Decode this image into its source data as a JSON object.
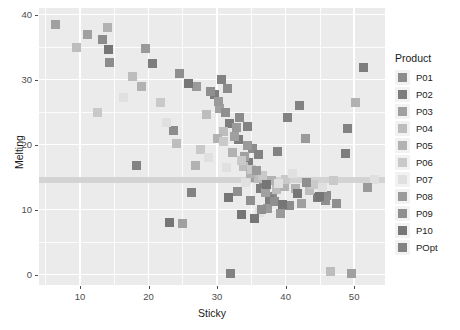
{
  "chart_data": {
    "type": "scatter",
    "title": "",
    "xlabel": "Sticky",
    "ylabel": "Melting",
    "xlim": [
      4.0,
      54.5
    ],
    "ylim": [
      -1.6,
      41.0
    ],
    "xticks": [
      10,
      20,
      30,
      40,
      50
    ],
    "yticks": [
      0,
      10,
      20,
      30,
      40
    ],
    "grid": true,
    "legend_position": "right",
    "legend_title": "Product",
    "marker": "square",
    "marker_size_px": 9,
    "panel_background": "#ebebeb",
    "gridline_color": "#ffffff",
    "reference_band": {
      "orientation": "horizontal",
      "y": 14.5,
      "color": "#d2d2d2"
    },
    "series": [
      {
        "name": "P01",
        "color": "#8c8c8c",
        "points": [
          [
            13.2,
            36.1
          ],
          [
            14.3,
            32.6
          ],
          [
            23.6,
            22.2
          ],
          [
            31.5,
            28.6
          ],
          [
            33.3,
            24.1
          ],
          [
            35.2,
            19.4
          ],
          [
            36.8,
            14.5
          ],
          [
            38.1,
            12.0
          ],
          [
            40.6,
            10.6
          ],
          [
            46.0,
            12.2
          ]
        ]
      },
      {
        "name": "P02",
        "color": "#7d7d7d",
        "points": [
          [
            20.5,
            32.5
          ],
          [
            29.6,
            27.7
          ],
          [
            31.8,
            23.2
          ],
          [
            33.1,
            20.8
          ],
          [
            34.6,
            17.2
          ],
          [
            36.3,
            13.3
          ],
          [
            37.6,
            11.5
          ],
          [
            44.7,
            11.8
          ],
          [
            48.8,
            18.6
          ],
          [
            51.3,
            31.9
          ]
        ]
      },
      {
        "name": "P03",
        "color": "#a0a0a0",
        "points": [
          [
            6.4,
            38.4
          ],
          [
            11.1,
            37.0
          ],
          [
            25.0,
            7.8
          ],
          [
            30.4,
            25.5
          ],
          [
            32.5,
            21.3
          ],
          [
            34.0,
            18.2
          ],
          [
            35.6,
            15.0
          ],
          [
            37.1,
            12.6
          ],
          [
            42.3,
            11.0
          ],
          [
            49.6,
            0.2
          ]
        ]
      },
      {
        "name": "P04",
        "color": "#bdbdbd",
        "points": [
          [
            9.5,
            34.9
          ],
          [
            17.6,
            30.4
          ],
          [
            24.0,
            20.1
          ],
          [
            28.5,
            24.6
          ],
          [
            31.0,
            22.0
          ],
          [
            33.8,
            16.6
          ],
          [
            36.0,
            14.8
          ],
          [
            38.6,
            13.1
          ],
          [
            43.5,
            12.9
          ],
          [
            46.6,
            0.4
          ]
        ]
      },
      {
        "name": "P05",
        "color": "#b2b2b2",
        "points": [
          [
            14.0,
            38.0
          ],
          [
            19.0,
            28.9
          ],
          [
            26.8,
            16.8
          ],
          [
            30.0,
            21.0
          ],
          [
            32.2,
            18.8
          ],
          [
            34.9,
            15.6
          ],
          [
            37.9,
            14.4
          ],
          [
            39.8,
            13.6
          ],
          [
            41.4,
            13.2
          ],
          [
            50.2,
            26.4
          ]
        ]
      },
      {
        "name": "P06",
        "color": "#c9c9c9",
        "points": [
          [
            12.6,
            24.9
          ],
          [
            21.8,
            26.4
          ],
          [
            27.6,
            19.2
          ],
          [
            30.9,
            20.4
          ],
          [
            33.5,
            17.6
          ],
          [
            35.0,
            16.2
          ],
          [
            36.6,
            15.2
          ],
          [
            40.0,
            14.6
          ],
          [
            44.0,
            13.8
          ],
          [
            47.0,
            14.4
          ]
        ]
      },
      {
        "name": "P07",
        "color": "#e0e0e0",
        "points": [
          [
            16.4,
            27.3
          ],
          [
            22.6,
            23.4
          ],
          [
            28.8,
            18.0
          ],
          [
            31.4,
            16.4
          ],
          [
            34.2,
            14.2
          ],
          [
            36.2,
            9.6
          ],
          [
            38.9,
            14.0
          ],
          [
            41.0,
            15.6
          ],
          [
            45.4,
            13.4
          ],
          [
            53.0,
            14.7
          ]
        ]
      },
      {
        "name": "P08",
        "color": "#9a9a9a",
        "points": [
          [
            19.6,
            34.7
          ],
          [
            27.0,
            29.0
          ],
          [
            30.2,
            26.6
          ],
          [
            32.8,
            22.6
          ],
          [
            34.4,
            19.8
          ],
          [
            35.8,
            16.0
          ],
          [
            37.4,
            10.2
          ],
          [
            39.2,
            9.4
          ],
          [
            42.9,
            20.9
          ],
          [
            52.0,
            13.4
          ]
        ]
      },
      {
        "name": "P09",
        "color": "#8f8f8f",
        "points": [
          [
            24.5,
            31.0
          ],
          [
            29.0,
            28.2
          ],
          [
            31.2,
            25.0
          ],
          [
            33.0,
            12.8
          ],
          [
            34.8,
            11.4
          ],
          [
            36.5,
            10.0
          ],
          [
            38.3,
            11.2
          ],
          [
            43.0,
            14.2
          ],
          [
            45.8,
            11.4
          ],
          [
            47.4,
            11.0
          ]
        ]
      },
      {
        "name": "P10",
        "color": "#767676",
        "points": [
          [
            14.1,
            34.6
          ],
          [
            23.0,
            8.0
          ],
          [
            25.8,
            29.4
          ],
          [
            31.6,
            11.8
          ],
          [
            33.6,
            9.2
          ],
          [
            35.4,
            8.6
          ],
          [
            37.2,
            13.8
          ],
          [
            39.5,
            10.8
          ],
          [
            41.8,
            12.4
          ],
          [
            45.0,
            12.0
          ]
        ]
      },
      {
        "name": "POpt",
        "color": "#828282",
        "points": [
          [
            18.2,
            16.8
          ],
          [
            26.2,
            12.6
          ],
          [
            30.6,
            30.0
          ],
          [
            32.0,
            0.2
          ],
          [
            34.5,
            22.8
          ],
          [
            36.0,
            18.4
          ],
          [
            38.8,
            19.0
          ],
          [
            40.2,
            24.2
          ],
          [
            42.0,
            26.0
          ],
          [
            49.0,
            22.5
          ]
        ]
      }
    ]
  },
  "axes": {
    "x_title": "Sticky",
    "y_title": "Melting",
    "x_tick_labels": [
      "10",
      "20",
      "30",
      "40",
      "50"
    ],
    "y_tick_labels": [
      "0",
      "10",
      "20",
      "30",
      "40"
    ]
  },
  "legend": {
    "title": "Product",
    "items": [
      {
        "label": "P01",
        "color": "#8c8c8c"
      },
      {
        "label": "P02",
        "color": "#7d7d7d"
      },
      {
        "label": "P03",
        "color": "#a0a0a0"
      },
      {
        "label": "P04",
        "color": "#bdbdbd"
      },
      {
        "label": "P05",
        "color": "#b2b2b2"
      },
      {
        "label": "P06",
        "color": "#c9c9c9"
      },
      {
        "label": "P07",
        "color": "#e0e0e0"
      },
      {
        "label": "P08",
        "color": "#9a9a9a"
      },
      {
        "label": "P09",
        "color": "#8f8f8f"
      },
      {
        "label": "P10",
        "color": "#767676"
      },
      {
        "label": "POpt",
        "color": "#828282"
      }
    ]
  }
}
